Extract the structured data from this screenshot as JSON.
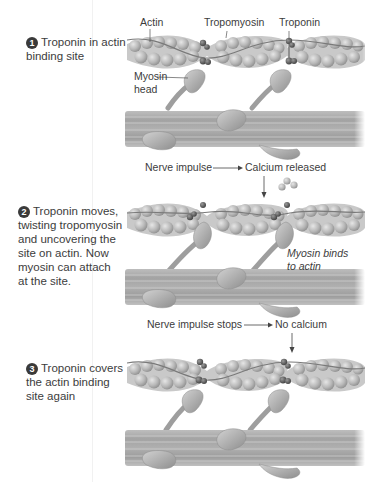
{
  "steps": [
    {
      "number": "1",
      "text_line1": "Troponin in actin",
      "text_line2": "binding site"
    },
    {
      "number": "2",
      "lines": [
        "Troponin moves,",
        "twisting tropomyosin",
        "and uncovering the",
        "site on actin. Now",
        "myosin can attach",
        "at the site."
      ]
    },
    {
      "number": "3",
      "lines": [
        "Troponin covers",
        "the actin binding",
        "site again"
      ]
    }
  ],
  "labels": {
    "actin": "Actin",
    "tropomyosin": "Tropomyosin",
    "troponin": "Troponin",
    "myosin_head_line1": "Myosin",
    "myosin_head_line2": "head",
    "myosin_binds_line1": "Myosin binds",
    "myosin_binds_line2": "to actin"
  },
  "events": {
    "release": {
      "cause": "Nerve impulse",
      "effect": "Calcium released"
    },
    "stop": {
      "cause": "Nerve impulse stops",
      "effect": "No calcium"
    }
  },
  "colors": {
    "background": "#ffffff",
    "text": "#3c3c3c",
    "actin_bead": "#b9b9b9",
    "troponin": "#6a6a6a",
    "myosin": "#a8a8a8"
  }
}
